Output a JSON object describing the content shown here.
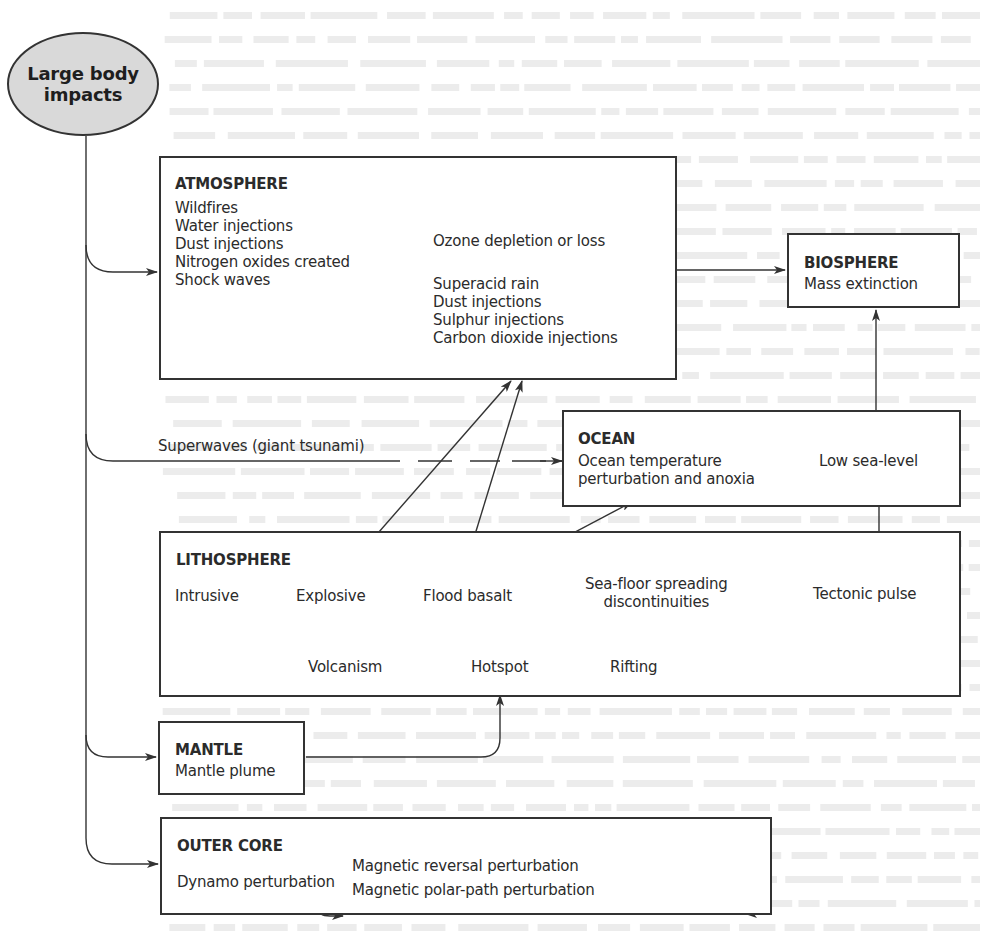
{
  "source": {
    "label": "Large body impacts",
    "lines": [
      "Large body",
      "impacts"
    ]
  },
  "atmosphere": {
    "title": "ATMOSPHERE",
    "items": [
      "Wildfires",
      "Water injections",
      "Dust injections",
      "Nitrogen oxides created",
      "Shock waves"
    ],
    "ozone": "Ozone depletion or loss",
    "effects": [
      "Superacid rain",
      "Dust injections",
      "Sulphur injections",
      "Carbon dioxide injections"
    ]
  },
  "biosphere": {
    "title": "BIOSPHERE",
    "item": "Mass extinction"
  },
  "superwaves": {
    "label": "Superwaves (giant tsunami)"
  },
  "ocean": {
    "title": "OCEAN",
    "effect_lines": [
      "Ocean temperature",
      "perturbation and anoxia"
    ],
    "sea_level": "Low sea-level"
  },
  "lithosphere": {
    "title": "LITHOSPHERE",
    "intrusive": "Intrusive",
    "explosive": "Explosive",
    "flood_basalt": "Flood basalt",
    "seafloor_lines": [
      "Sea-floor spreading",
      "discontinuities"
    ],
    "tectonic_pulse": "Tectonic pulse",
    "volcanism": "Volcanism",
    "hotspot": "Hotspot",
    "rifting": "Rifting"
  },
  "mantle": {
    "title": "MANTLE",
    "item": "Mantle plume"
  },
  "outer_core": {
    "title": "OUTER CORE",
    "dynamo": "Dynamo perturbation",
    "reversal": "Magnetic reversal perturbation",
    "polar_path": "Magnetic polar-path perturbation"
  },
  "colors": {
    "ink": "#2b2b2b",
    "line": "#333333",
    "ellipse_fill": "#d9d9d9",
    "bleed_text": "#ececec"
  }
}
